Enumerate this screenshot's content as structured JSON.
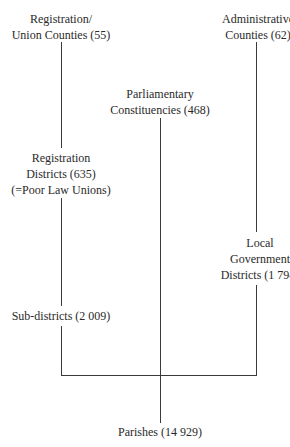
{
  "diagram": {
    "nodes": {
      "registration_union_counties": {
        "lines": [
          "Registration/",
          "Union Counties (55)"
        ],
        "label": "Registration/Union Counties",
        "count": "55"
      },
      "administrative_counties": {
        "lines": [
          "Administrative",
          "Counties (62)"
        ],
        "label": "Administrative Counties",
        "count": "62"
      },
      "parliamentary_constituencies": {
        "lines": [
          "Parliamentary",
          "Constituencies (468)"
        ],
        "label": "Parliamentary Constituencies",
        "count": "468"
      },
      "registration_districts": {
        "lines": [
          "Registration",
          "Districts (635)",
          "(=Poor Law Unions)"
        ],
        "label": "Registration Districts",
        "count": "635",
        "note": "(=Poor Law Unions)"
      },
      "local_government_districts": {
        "lines": [
          "Local",
          "Government",
          "Districts (1 794)"
        ],
        "label": "Local Government Districts",
        "count": "1 794"
      },
      "sub_districts": {
        "lines": [
          "Sub-districts (2 009)"
        ],
        "label": "Sub-districts",
        "count": "2 009"
      },
      "parishes": {
        "lines": [
          "Parishes (14 929)"
        ],
        "label": "Parishes",
        "count": "14 929"
      }
    },
    "edges": [
      {
        "from": "registration_union_counties",
        "to": "registration_districts"
      },
      {
        "from": "registration_districts",
        "to": "sub_districts"
      },
      {
        "from": "sub_districts",
        "to": "parishes"
      },
      {
        "from": "administrative_counties",
        "to": "local_government_districts"
      },
      {
        "from": "local_government_districts",
        "to": "parishes"
      },
      {
        "from": "parliamentary_constituencies",
        "to": "parishes"
      }
    ],
    "line_color": "#3a3a3a"
  }
}
